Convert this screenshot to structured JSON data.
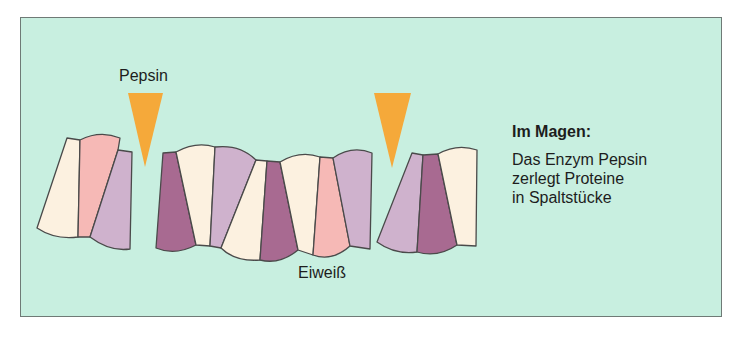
{
  "diagram": {
    "enzyme_label": "Pepsin",
    "substrate_label": "Eiweiß",
    "side_text": {
      "title": "Im Magen:",
      "lines": [
        "Das Enzym Pepsin",
        "zerlegt Proteine",
        "in Spaltstücke"
      ]
    },
    "colors": {
      "background": "#c8efe0",
      "enzyme": "#f5a93a",
      "segment_cream": "#fcf1e0",
      "segment_pink": "#f6b9b6",
      "segment_lilac": "#cfb2cd",
      "segment_plum": "#a86a91",
      "outline": "#4a4a4a"
    },
    "enzymes": [
      {
        "name": "pepsin-cut-1",
        "position": "left"
      },
      {
        "name": "pepsin-cut-2",
        "position": "right"
      }
    ],
    "fragments": [
      {
        "name": "left-fragment",
        "segments": [
          "cream",
          "pink",
          "lilac"
        ]
      },
      {
        "name": "middle-fragment",
        "segments": [
          "plum",
          "cream",
          "lilac",
          "cream",
          "plum",
          "cream",
          "pink",
          "lilac"
        ]
      },
      {
        "name": "right-fragment",
        "segments": [
          "lilac",
          "plum",
          "cream"
        ]
      }
    ]
  }
}
